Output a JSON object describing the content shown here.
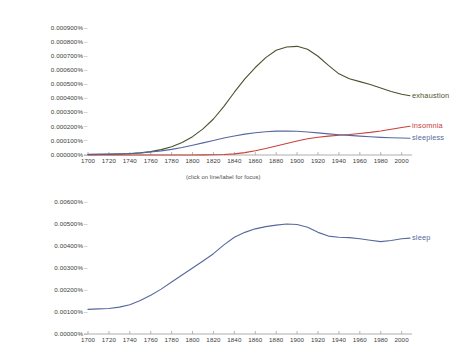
{
  "hint_text": "(click on line/label for focus)",
  "colors": {
    "exhaustion": "#47542e",
    "insomnia": "#c8413a",
    "sleepless": "#56689e",
    "sleep": "#56689e",
    "axis": "#999999",
    "tick_text": "#3b3b3b"
  },
  "chart_data": [
    {
      "type": "line",
      "title": "",
      "xlabel": "",
      "ylabel": "",
      "xlim": [
        1700,
        2008
      ],
      "ylim": [
        0,
        0.0009
      ],
      "grid": false,
      "legend_position": "right-inline",
      "xticks": [
        1700,
        1720,
        1740,
        1760,
        1780,
        1800,
        1820,
        1840,
        1860,
        1880,
        1900,
        1920,
        1940,
        1960,
        1980,
        2000
      ],
      "ytick_labels": [
        "0.000000%",
        "0.000100%",
        "0.000200%",
        "0.000300%",
        "0.000400%",
        "0.000500%",
        "0.000600%",
        "0.000700%",
        "0.000800%",
        "0.000900%"
      ],
      "yticks": [
        0,
        0.0001,
        0.0002,
        0.0003,
        0.0004,
        0.0005,
        0.0006,
        0.0007,
        0.0008,
        0.0009
      ],
      "x": [
        1700,
        1710,
        1720,
        1730,
        1740,
        1750,
        1760,
        1770,
        1780,
        1790,
        1800,
        1810,
        1820,
        1830,
        1840,
        1850,
        1860,
        1870,
        1880,
        1890,
        1900,
        1910,
        1920,
        1930,
        1940,
        1950,
        1960,
        1970,
        1980,
        1990,
        2000,
        2008
      ],
      "series": [
        {
          "name": "exhaustion",
          "color": "#47542e",
          "values": [
            3e-06,
            3.5e-06,
            4.5e-06,
            6e-06,
            9e-06,
            1.5e-05,
            2.4e-05,
            3.8e-05,
            5.8e-05,
            8.8e-05,
            0.00013,
            0.000185,
            0.000255,
            0.000345,
            0.000445,
            0.00054,
            0.00062,
            0.00069,
            0.000742,
            0.000765,
            0.00077,
            0.00075,
            0.0007,
            0.000635,
            0.000575,
            0.00054,
            0.00052,
            0.0005,
            0.000475,
            0.00045,
            0.00043,
            0.00042
          ]
        },
        {
          "name": "insomnia",
          "color": "#c8413a",
          "values": [
            0.0,
            0.0,
            0.0,
            0.0,
            0.0,
            0.0,
            0.0,
            0.0,
            0.0,
            0.0,
            0.0,
            1e-06,
            2e-06,
            4e-06,
            8e-06,
            1.7e-05,
            3e-05,
            4.6e-05,
            6.4e-05,
            8.2e-05,
            9.9e-05,
            0.000115,
            0.000126,
            0.000134,
            0.00014,
            0.000145,
            0.000152,
            0.00016,
            0.00017,
            0.000182,
            0.000195,
            0.000204
          ]
        },
        {
          "name": "sleepless",
          "color": "#56689e",
          "values": [
            5e-06,
            6e-06,
            7e-06,
            8.5e-06,
            1.1e-05,
            1.5e-05,
            2.1e-05,
            2.9e-05,
            4e-05,
            5.3e-05,
            6.9e-05,
            8.6e-05,
            0.000103,
            0.00012,
            0.000135,
            0.000148,
            0.000158,
            0.000165,
            0.000169,
            0.00017,
            0.000168,
            0.000163,
            0.000157,
            0.00015,
            0.000144,
            0.000139,
            0.000134,
            0.000129,
            0.000125,
            0.000122,
            0.00012,
            0.000119
          ]
        }
      ]
    },
    {
      "type": "line",
      "title": "",
      "xlabel": "",
      "ylabel": "",
      "xlim": [
        1700,
        2008
      ],
      "ylim": [
        0,
        0.006
      ],
      "grid": false,
      "legend_position": "right-inline",
      "xticks": [
        1700,
        1720,
        1740,
        1760,
        1780,
        1800,
        1820,
        1840,
        1860,
        1880,
        1900,
        1920,
        1940,
        1960,
        1980,
        2000
      ],
      "ytick_labels": [
        "0.00000%",
        "0.00100%",
        "0.00200%",
        "0.00300%",
        "0.00400%",
        "0.00500%",
        "0.00600%"
      ],
      "yticks": [
        0,
        0.001,
        0.002,
        0.003,
        0.004,
        0.005,
        0.006
      ],
      "x": [
        1700,
        1710,
        1720,
        1730,
        1740,
        1750,
        1760,
        1770,
        1780,
        1790,
        1800,
        1810,
        1820,
        1830,
        1840,
        1850,
        1860,
        1870,
        1880,
        1890,
        1900,
        1910,
        1920,
        1930,
        1940,
        1950,
        1960,
        1970,
        1980,
        1990,
        2000,
        2008
      ],
      "series": [
        {
          "name": "sleep",
          "color": "#56689e",
          "values": [
            0.00112,
            0.00114,
            0.00116,
            0.00122,
            0.00133,
            0.00152,
            0.00176,
            0.00204,
            0.00236,
            0.00268,
            0.003,
            0.00332,
            0.00365,
            0.00405,
            0.0044,
            0.00462,
            0.00478,
            0.00488,
            0.00495,
            0.005,
            0.00498,
            0.00485,
            0.00462,
            0.00445,
            0.0044,
            0.00438,
            0.00433,
            0.00426,
            0.0042,
            0.00425,
            0.00433,
            0.00436
          ]
        }
      ]
    }
  ]
}
